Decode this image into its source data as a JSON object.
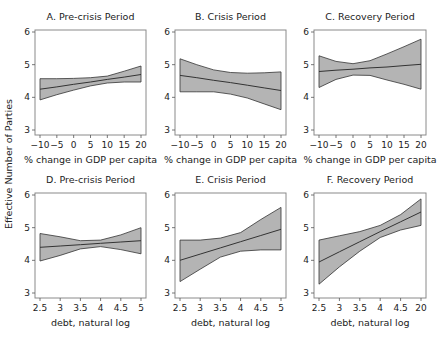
{
  "figure": {
    "y_axis_label": "Effective Number of Parties"
  },
  "chart_data": [
    {
      "type": "line",
      "panel": "A",
      "title": "A. Pre-crisis Period",
      "xlabel": "% change in GDP per capita",
      "ylabel": "Effective Number of Parties",
      "x_ticks": [
        -10,
        -5,
        0,
        5,
        10,
        15,
        20
      ],
      "x_tick_labels": [
        "−10",
        "−5",
        "0",
        "5",
        "10",
        "15",
        "20"
      ],
      "xlim": [
        -10,
        20
      ],
      "y_ticks": [
        3,
        4,
        5,
        6
      ],
      "ylim": [
        3,
        6
      ],
      "grid": false,
      "x": [
        -10,
        -5,
        0,
        5,
        10,
        15,
        20
      ],
      "series": [
        {
          "name": "predicted",
          "values": [
            4.25,
            4.32,
            4.4,
            4.47,
            4.55,
            4.62,
            4.7
          ]
        },
        {
          "name": "upper_ci",
          "values": [
            4.57,
            4.57,
            4.58,
            4.6,
            4.65,
            4.8,
            4.96
          ]
        },
        {
          "name": "lower_ci",
          "values": [
            3.92,
            4.08,
            4.22,
            4.35,
            4.44,
            4.47,
            4.47
          ]
        }
      ]
    },
    {
      "type": "line",
      "panel": "B",
      "title": "B. Crisis Period",
      "xlabel": "% change in GDP per capita",
      "ylabel": "Effective Number of Parties",
      "x_ticks": [
        -10,
        -5,
        0,
        5,
        10,
        15,
        20
      ],
      "x_tick_labels": [
        "−10",
        "−5",
        "0",
        "5",
        "10",
        "15",
        "20"
      ],
      "xlim": [
        -10,
        20
      ],
      "y_ticks": [
        3,
        4,
        5,
        6
      ],
      "ylim": [
        3,
        6
      ],
      "grid": false,
      "x": [
        -10,
        -5,
        0,
        5,
        10,
        15,
        20
      ],
      "series": [
        {
          "name": "predicted",
          "values": [
            4.67,
            4.6,
            4.52,
            4.45,
            4.37,
            4.29,
            4.21
          ]
        },
        {
          "name": "upper_ci",
          "values": [
            5.18,
            5.0,
            4.84,
            4.76,
            4.74,
            4.75,
            4.78
          ]
        },
        {
          "name": "lower_ci",
          "values": [
            4.17,
            4.17,
            4.17,
            4.1,
            3.98,
            3.8,
            3.62
          ]
        }
      ]
    },
    {
      "type": "line",
      "panel": "C",
      "title": "C. Recovery Period",
      "xlabel": "% change in GDP per capita",
      "ylabel": "Effective Number of Parties",
      "x_ticks": [
        -10,
        -5,
        0,
        5,
        10,
        15,
        20
      ],
      "x_tick_labels": [
        "−10",
        "−5",
        "0",
        "5",
        "10",
        "15",
        "20"
      ],
      "xlim": [
        -10,
        20
      ],
      "y_ticks": [
        3,
        4,
        5,
        6
      ],
      "ylim": [
        3,
        6
      ],
      "grid": false,
      "x": [
        -10,
        -5,
        0,
        5,
        10,
        15,
        20
      ],
      "series": [
        {
          "name": "predicted",
          "values": [
            4.79,
            4.83,
            4.86,
            4.9,
            4.93,
            4.97,
            5.01
          ]
        },
        {
          "name": "upper_ci",
          "values": [
            5.27,
            5.1,
            5.03,
            5.12,
            5.33,
            5.55,
            5.78
          ]
        },
        {
          "name": "lower_ci",
          "values": [
            4.3,
            4.55,
            4.68,
            4.67,
            4.53,
            4.4,
            4.25
          ]
        }
      ]
    },
    {
      "type": "line",
      "panel": "D",
      "title": "D. Pre-crisis Period",
      "xlabel": "debt, natural log",
      "ylabel": "Effective Number of Parties",
      "x_ticks": [
        2.5,
        3,
        3.5,
        4,
        4.5,
        5
      ],
      "x_tick_labels": [
        "2.5",
        "3",
        "3.5",
        "4",
        "4.5",
        "5"
      ],
      "xlim": [
        2.5,
        5
      ],
      "y_ticks": [
        3,
        4,
        5,
        6
      ],
      "ylim": [
        3,
        6
      ],
      "grid": false,
      "x": [
        2.5,
        3,
        3.5,
        4,
        4.5,
        5
      ],
      "series": [
        {
          "name": "predicted",
          "values": [
            4.4,
            4.44,
            4.48,
            4.52,
            4.56,
            4.6
          ]
        },
        {
          "name": "upper_ci",
          "values": [
            4.82,
            4.72,
            4.6,
            4.62,
            4.78,
            5.0
          ]
        },
        {
          "name": "lower_ci",
          "values": [
            3.98,
            4.15,
            4.35,
            4.42,
            4.33,
            4.2
          ]
        }
      ]
    },
    {
      "type": "line",
      "panel": "E",
      "title": "E. Crisis Period",
      "xlabel": "debt, natural log",
      "ylabel": "Effective Number of Parties",
      "x_ticks": [
        2.5,
        3,
        3.5,
        4,
        4.5,
        5
      ],
      "x_tick_labels": [
        "2.5",
        "3",
        "3.5",
        "4",
        "4.5",
        "5"
      ],
      "xlim": [
        2.5,
        5
      ],
      "y_ticks": [
        3,
        4,
        5,
        6
      ],
      "ylim": [
        3,
        6
      ],
      "grid": false,
      "x": [
        2.5,
        3,
        3.5,
        4,
        4.5,
        5
      ],
      "series": [
        {
          "name": "predicted",
          "values": [
            4.0,
            4.19,
            4.38,
            4.57,
            4.76,
            4.95
          ]
        },
        {
          "name": "upper_ci",
          "values": [
            4.62,
            4.62,
            4.68,
            4.85,
            5.25,
            5.62
          ]
        },
        {
          "name": "lower_ci",
          "values": [
            3.35,
            3.73,
            4.1,
            4.28,
            4.32,
            4.32
          ]
        }
      ]
    },
    {
      "type": "line",
      "panel": "F",
      "title": "F. Recovery Period",
      "xlabel": "debt, natural log",
      "ylabel": "Effective Number of Parties",
      "x_ticks": [
        2.5,
        3,
        3.5,
        4,
        4.5,
        5
      ],
      "x_tick_labels": [
        "2.5",
        "3",
        "3.5",
        "4",
        "4.5",
        "20"
      ],
      "xlim": [
        2.5,
        5
      ],
      "y_ticks": [
        3,
        4,
        5,
        6
      ],
      "ylim": [
        3,
        6
      ],
      "grid": false,
      "x": [
        2.5,
        3,
        3.5,
        4,
        4.5,
        5
      ],
      "series": [
        {
          "name": "predicted",
          "values": [
            3.95,
            4.26,
            4.57,
            4.88,
            5.18,
            5.48
          ]
        },
        {
          "name": "upper_ci",
          "values": [
            4.62,
            4.75,
            4.88,
            5.07,
            5.4,
            5.88
          ]
        },
        {
          "name": "lower_ci",
          "values": [
            3.27,
            3.8,
            4.28,
            4.7,
            4.93,
            5.07
          ]
        }
      ]
    }
  ]
}
